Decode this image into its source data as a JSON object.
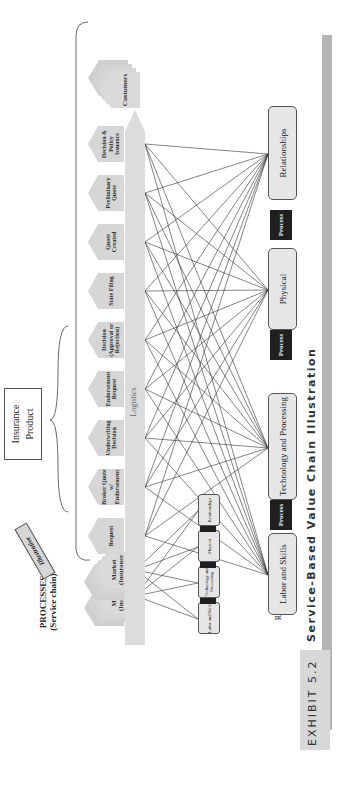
{
  "exhibit": {
    "number_label": "EXHIBIT 5.2",
    "title": "Service-Based Value Chain Illustration",
    "band_color": "#b5b5b5",
    "tab_color": "#d8d8d8"
  },
  "labels": {
    "processes_title": "PROCESSES",
    "processes_subtitle": "(Service chain)",
    "resources_title": "RESOURCES",
    "illustrative_tag": "Illustrative",
    "insurance_product": "Insurance Product",
    "logistics": "Logistics"
  },
  "markets": [
    {
      "label": "Market (Insurance Brokers)"
    },
    {
      "label": "Market (Insurance Carriers)"
    }
  ],
  "process_steps": [
    {
      "label": "Request"
    },
    {
      "label": "Broker Quote w/ Endorsement"
    },
    {
      "label": "Underwriting Decision"
    },
    {
      "label": "Endorsement Request"
    },
    {
      "label": "Decision (Approval or Rejection)"
    },
    {
      "label": "State Filing"
    },
    {
      "label": "Quote Created"
    },
    {
      "label": "Preliminary Quote"
    },
    {
      "label": "Decision & Policy Issuance"
    }
  ],
  "customers": {
    "label": "Customers"
  },
  "resources": [
    {
      "label": "Labor and Skills"
    },
    {
      "label": "Technology and Processing"
    },
    {
      "label": "Physical"
    },
    {
      "label": "Relationships"
    }
  ],
  "process_connector_label": "Process",
  "mini_resources": [
    {
      "label": "Labor and Skills"
    },
    {
      "label": "Technology and Processing"
    },
    {
      "label": "Physical"
    },
    {
      "label": "Relationships"
    }
  ],
  "colors": {
    "box_fill": "#d6d6d6",
    "resource_fill": "#e6e6e6",
    "process_tag": "#1f1f1f",
    "line": "#333333"
  }
}
